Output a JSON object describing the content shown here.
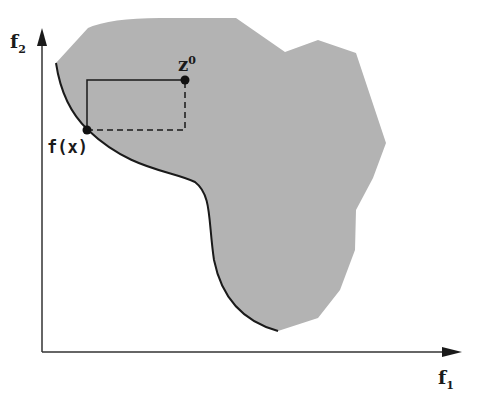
{
  "diagram": {
    "type": "objective-space",
    "fill_color": "#b3b3b3",
    "line_color": "#1a1a1a",
    "axes": {
      "x_label": "f",
      "x_sub": "1",
      "y_label": "f",
      "y_sub": "2"
    },
    "points": {
      "reference_point": {
        "label": "z",
        "sup": "0"
      },
      "solution_point": {
        "label": "f(x)"
      }
    }
  }
}
